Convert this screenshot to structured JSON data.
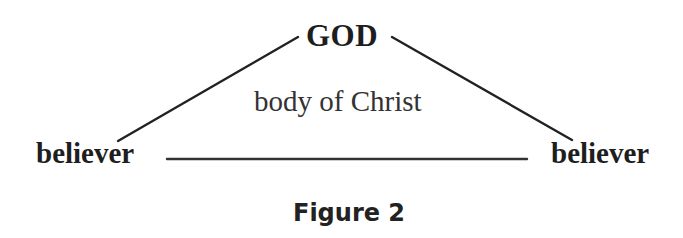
{
  "diagram": {
    "nodes": {
      "top": "GOD",
      "left": "believer",
      "right": "believer"
    },
    "center_label": "body of Christ",
    "caption": "Figure 2",
    "edges": [
      {
        "from": "left",
        "to": "top"
      },
      {
        "from": "top",
        "to": "right"
      },
      {
        "from": "left",
        "to": "right"
      }
    ],
    "line_color": "#222222"
  }
}
